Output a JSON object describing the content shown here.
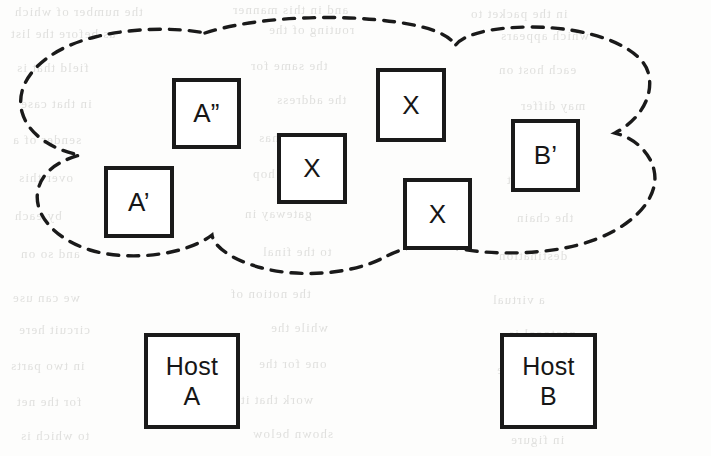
{
  "figure": {
    "type": "network-cloud-diagram",
    "background_color": "#fdfdfc",
    "stroke_color": "#1a1a1a",
    "cloud": {
      "name": "network-cloud",
      "style": "dashed",
      "dash_pattern": "11 9",
      "stroke_width": 3.4,
      "fill": "none"
    }
  },
  "nodes": [
    {
      "id": "a-double-prime",
      "label": "A”",
      "x": 172,
      "y": 78,
      "w": 69,
      "h": 71,
      "inside_cloud": true
    },
    {
      "id": "a-prime",
      "label": "A’",
      "x": 104,
      "y": 166,
      "w": 70,
      "h": 72,
      "inside_cloud": true
    },
    {
      "id": "x-middle",
      "label": "X",
      "x": 277,
      "y": 133,
      "w": 70,
      "h": 71,
      "inside_cloud": true
    },
    {
      "id": "x-top",
      "label": "X",
      "x": 376,
      "y": 68,
      "w": 70,
      "h": 74,
      "inside_cloud": true
    },
    {
      "id": "x-lower",
      "label": "X",
      "x": 403,
      "y": 178,
      "w": 69,
      "h": 72,
      "inside_cloud": true
    },
    {
      "id": "b-prime",
      "label": "B’",
      "x": 511,
      "y": 119,
      "w": 69,
      "h": 73,
      "inside_cloud": true
    }
  ],
  "hosts": [
    {
      "id": "host-a",
      "label": "Host\nA",
      "line1": "Host",
      "line2": "A",
      "x": 144,
      "y": 333,
      "w": 96,
      "h": 96,
      "inside_cloud": false
    },
    {
      "id": "host-b",
      "label": "Host\nB",
      "line1": "Host",
      "line2": "B",
      "x": 500,
      "y": 333,
      "w": 97,
      "h": 96,
      "inside_cloud": false
    }
  ],
  "ghost_text": [
    {
      "text": "the number of which",
      "x": 14,
      "y": 4
    },
    {
      "text": "and in this manner",
      "x": 232,
      "y": 2
    },
    {
      "text": "in the packet to",
      "x": 470,
      "y": 6
    },
    {
      "text": "as before the list",
      "x": 10,
      "y": 26
    },
    {
      "text": "routing of the",
      "x": 268,
      "y": 22
    },
    {
      "text": "which appears",
      "x": 500,
      "y": 28
    },
    {
      "text": "field that is",
      "x": 16,
      "y": 60
    },
    {
      "text": "the same for",
      "x": 250,
      "y": 58
    },
    {
      "text": "each host on",
      "x": 498,
      "y": 62
    },
    {
      "text": "in that case",
      "x": 20,
      "y": 96
    },
    {
      "text": "the address",
      "x": 276,
      "y": 92
    },
    {
      "text": "may differ",
      "x": 520,
      "y": 98
    },
    {
      "text": "sender of a",
      "x": 12,
      "y": 132
    },
    {
      "text": "datagram has",
      "x": 258,
      "y": 130
    },
    {
      "text": "no control",
      "x": 512,
      "y": 134
    },
    {
      "text": "over this",
      "x": 18,
      "y": 170
    },
    {
      "text": "so the hop",
      "x": 252,
      "y": 166
    },
    {
      "text": "count is set",
      "x": 506,
      "y": 172
    },
    {
      "text": "by each",
      "x": 14,
      "y": 208
    },
    {
      "text": "gateway in",
      "x": 244,
      "y": 206
    },
    {
      "text": "the chain",
      "x": 516,
      "y": 210
    },
    {
      "text": "and so on",
      "x": 20,
      "y": 246
    },
    {
      "text": "to the final",
      "x": 262,
      "y": 244
    },
    {
      "text": "destination",
      "x": 498,
      "y": 248
    },
    {
      "text": "we can use",
      "x": 12,
      "y": 290
    },
    {
      "text": "the notion of",
      "x": 230,
      "y": 286
    },
    {
      "text": "a virtual",
      "x": 492,
      "y": 292
    },
    {
      "text": "circuit here",
      "x": 18,
      "y": 322
    },
    {
      "text": "while the",
      "x": 270,
      "y": 320
    },
    {
      "text": "protocol is",
      "x": 508,
      "y": 326
    },
    {
      "text": "in two parts",
      "x": 10,
      "y": 358
    },
    {
      "text": "one for the",
      "x": 258,
      "y": 356
    },
    {
      "text": "host and one",
      "x": 496,
      "y": 362
    },
    {
      "text": "for the net",
      "x": 16,
      "y": 394
    },
    {
      "text": "work that it",
      "x": 240,
      "y": 392
    },
    {
      "text": "is attached",
      "x": 502,
      "y": 398
    },
    {
      "text": "to which is",
      "x": 20,
      "y": 428
    },
    {
      "text": "shown below",
      "x": 252,
      "y": 426
    },
    {
      "text": "in figure",
      "x": 510,
      "y": 432
    }
  ]
}
